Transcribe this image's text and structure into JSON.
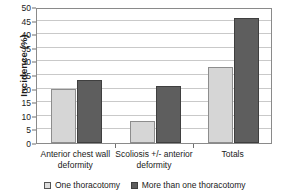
{
  "chart_data": {
    "type": "bar",
    "title": "",
    "xlabel": "",
    "ylabel": "Incidence (%)",
    "ylim": [
      0,
      50
    ],
    "ytick_step": 5,
    "yticks": [
      0,
      5,
      10,
      15,
      20,
      25,
      30,
      35,
      40,
      45,
      50
    ],
    "grid": true,
    "legend_position": "bottom",
    "categories": [
      "Anterior chest wall deformity",
      "Scoliosis +/- anterior deformity",
      "Totals"
    ],
    "series": [
      {
        "name": "One thoracotomy",
        "color": "#d6d6d6",
        "values": [
          20,
          8,
          28
        ]
      },
      {
        "name": "More than one thoracotomy",
        "color": "#5e5e5e",
        "values": [
          23,
          21,
          46
        ]
      }
    ]
  },
  "legend": {
    "items": [
      {
        "label": "One thoracotomy",
        "style": "light"
      },
      {
        "label": "More than one thoracotomy",
        "style": "dark"
      }
    ]
  },
  "colors": {
    "series_light": "#d6d6d6",
    "series_dark": "#5e5e5e",
    "gridline": "#c9c9c9",
    "axis": "#8a8a8a",
    "text": "#1a1a1a"
  }
}
